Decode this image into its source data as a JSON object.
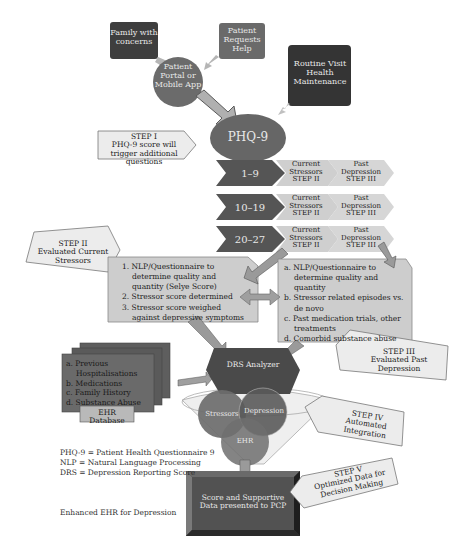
{
  "sources": {
    "family": "Family with concerns",
    "patient_requests": "Patient Requests Help",
    "portal": "Patient Portal or Mobile App",
    "routine": "Routine Visit Health Maintenance"
  },
  "phq9": {
    "label": "PHQ-9"
  },
  "step1": {
    "title": "STEP I",
    "desc": "PHQ-9 score will trigger additional questions"
  },
  "score_rows": [
    {
      "range": "1–9",
      "current": "Current Stressors STEP II",
      "past": "Past Depression STEP III"
    },
    {
      "range": "10–19",
      "current": "Current Stressors STEP II",
      "past": "Past Depression STEP III"
    },
    {
      "range": "20–27",
      "current": "Current Stressors STEP II",
      "past": "Past Depression STEP III"
    }
  ],
  "step2": {
    "title": "STEP II",
    "desc": "Evaluated Current Stressors",
    "items": [
      "1. NLP/Questionnaire to determine quality and quantity (Selye Score)",
      "2. Stressor score determined",
      "3. Stressor score weighed against depressive symptoms"
    ]
  },
  "step3": {
    "title": "STEP III",
    "desc": "Evaluated Past Depression",
    "items": [
      "a. NLP/Questionnaire to determine quality and quantity",
      "b. Stressor related episodes vs. de novo",
      "c. Past medication trials, other treatments",
      "d. Comorbid substance abuse"
    ]
  },
  "ehr": {
    "items": [
      "a. Previous Hospitalisations",
      "b. Medications",
      "c. Family History",
      "d. Substance Abuse"
    ],
    "label": "EHR Database"
  },
  "drs": {
    "label": "DRS Analyzer"
  },
  "funnel": {
    "stressors": "Stressors",
    "depression": "Depression",
    "ehr": "EHR"
  },
  "step4": {
    "title": "STEP IV",
    "desc": "Automated Integration"
  },
  "step5": {
    "title": "STEP V",
    "desc": "Optimized Data for Decision Making"
  },
  "output": {
    "label": "Score and Supportive Data presented to PCP"
  },
  "legend": [
    "PHQ-9 = Patient Health Questionnaire 9",
    "NLP = Natural Language Processing",
    "DRS = Depression Reporting Score"
  ],
  "caption": "Enhanced EHR for Depression",
  "colors": {
    "dark": "#3a3a3a",
    "mid": "#5e5e5e",
    "phq": "#666666",
    "light_box": "#cfcfcf",
    "callout": "#ececec",
    "arrow": "#a9a9a9"
  }
}
